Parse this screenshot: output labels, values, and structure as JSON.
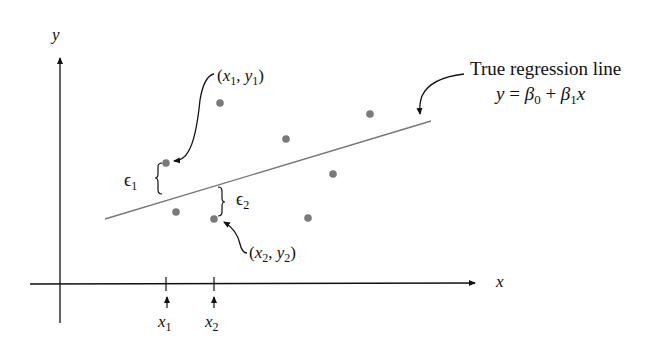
{
  "diagram": {
    "title_label": "True regression line",
    "equation": {
      "y": "y",
      "eq": " = ",
      "beta": "β",
      "sub0": "0",
      "plus": " + ",
      "sub1": "1",
      "x": "x"
    },
    "axes": {
      "x_label": "x",
      "y_label": "y"
    },
    "ticks": [
      {
        "label": "x",
        "sub": "1"
      },
      {
        "label": "x",
        "sub": "2"
      }
    ],
    "point_labels": {
      "p1": {
        "open": "(",
        "x": "x",
        "xsub": "1",
        "comma": ", ",
        "y": "y",
        "ysub": "1",
        "close": ")"
      },
      "p2": {
        "open": "(",
        "x": "x",
        "xsub": "2",
        "comma": ", ",
        "y": "y",
        "ysub": "2",
        "close": ")"
      }
    },
    "errors": [
      {
        "symbol": "ϵ",
        "sub": "1"
      },
      {
        "symbol": "ϵ",
        "sub": "2"
      }
    ],
    "colors": {
      "axis": "#111111",
      "line": "#777777",
      "point": "#7a7a7a",
      "annotation": "#111111"
    }
  }
}
